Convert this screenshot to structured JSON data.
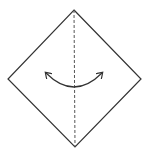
{
  "diagram": {
    "type": "origami-fold-step",
    "paper_shape": "diamond",
    "vertices": {
      "top": [
        74,
        10
      ],
      "right": [
        141,
        79
      ],
      "bottom": [
        75,
        147
      ],
      "left": [
        8,
        79
      ]
    },
    "fold_line": {
      "style": "dashed",
      "kind": "valley-fold",
      "from": [
        74,
        10
      ],
      "to": [
        75,
        147
      ]
    },
    "arrow": {
      "kind": "curved-double-headed",
      "start": [
        46,
        73
      ],
      "control": [
        74,
        101
      ],
      "end": [
        102,
        73
      ]
    },
    "colors": {
      "stroke": "#333333",
      "background": "#ffffff"
    }
  }
}
